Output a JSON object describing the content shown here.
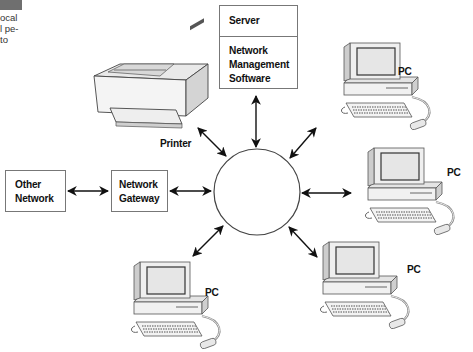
{
  "sidebar_fragment": {
    "lines": [
      "ocal",
      "l pe-",
      "to"
    ]
  },
  "server_box": {
    "title": "Server",
    "lines": [
      "Network",
      "Management",
      "Software"
    ]
  },
  "printer": {
    "label": "Printer"
  },
  "other_network": {
    "lines": [
      "Other",
      "Network"
    ]
  },
  "gateway": {
    "lines": [
      "Network",
      "Gateway"
    ]
  },
  "pcs": [
    {
      "label": "PC",
      "position": "top-right"
    },
    {
      "label": "PC",
      "position": "right"
    },
    {
      "label": "PC",
      "position": "bottom-right"
    },
    {
      "label": "PC",
      "position": "bottom-left"
    }
  ],
  "hub": {
    "shape": "circle"
  },
  "colors": {
    "line": "#111111",
    "box_border": "#777777",
    "sidebar_bar": "#6f6f6f",
    "screen": "#e6e6e6",
    "device": "#f2f2f2"
  }
}
